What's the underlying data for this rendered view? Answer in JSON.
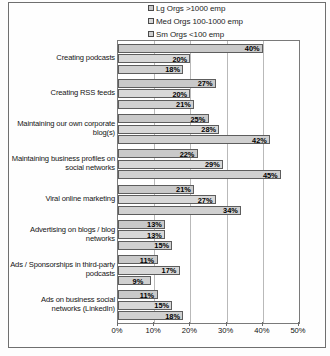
{
  "chart_data": {
    "type": "bar",
    "orientation": "horizontal",
    "title": "",
    "xlabel": "",
    "ylabel": "",
    "xlim": [
      0,
      50
    ],
    "x_ticks": [
      "0%",
      "10%",
      "20%",
      "30%",
      "40%",
      "50%"
    ],
    "x_tick_values": [
      0,
      10,
      20,
      30,
      40,
      50
    ],
    "grid": true,
    "legend_position": "top-right",
    "value_suffix": "%",
    "categories": [
      "Creating podcasts",
      "Creating RSS feeds",
      "Maintaining our own corporate blog(s)",
      "Maintaining business profiles on social networks",
      "Viral online marketing",
      "Advertising on blogs / blog networks",
      "Ads / Sponsorships in third-party podcasts",
      "Ads on business social networks (LinkedIn)"
    ],
    "series": [
      {
        "name": "Lg Orgs >1000 emp",
        "color": "#c9c9c9",
        "values": [
          40,
          27,
          25,
          22,
          21,
          13,
          11,
          11
        ],
        "labels": [
          "40%",
          "27%",
          "25%",
          "22%",
          "21%",
          "13%",
          "11%",
          "11%"
        ]
      },
      {
        "name": "Med Orgs 100-1000 emp",
        "color": "#d8d8d8",
        "values": [
          20,
          20,
          28,
          29,
          27,
          13,
          17,
          15
        ],
        "labels": [
          "20%",
          "20%",
          "28%",
          "29%",
          "27%",
          "13%",
          "17%",
          "15%"
        ]
      },
      {
        "name": "Sm Orgs <100 emp",
        "color": "#d0d0d0",
        "values": [
          18,
          21,
          42,
          45,
          34,
          15,
          9,
          18
        ],
        "labels": [
          "18%",
          "21%",
          "42%",
          "45%",
          "34%",
          "15%",
          "9%",
          "18%"
        ]
      }
    ]
  }
}
